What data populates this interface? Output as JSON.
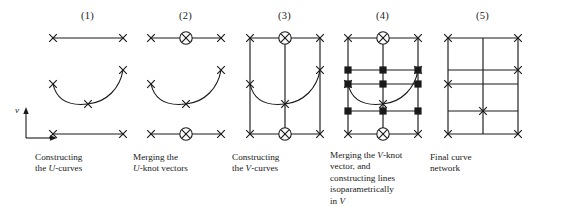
{
  "figure": {
    "background_color": "#ffffff",
    "ink_color": "#1a1a1a",
    "axis": {
      "label_v": "v",
      "name": "v-axis-indicator",
      "origin_x": 26,
      "origin_y": 137,
      "arrow_up_len": 26,
      "arrow_right_len": 30
    },
    "marker_legend": {
      "x_mark": "knot (X cross)",
      "circled_x": "merged knot (X inside circle)",
      "square_x": "isoparametric line node (filled square with X)"
    },
    "panels": [
      {
        "number": "(1)",
        "name": "panel-constructing-u-curves",
        "left": 35,
        "width": 105,
        "caption_lines": [
          "Constructing",
          "the U-curves"
        ],
        "caption_italic_word": "U",
        "caption_plain": "Constructing the U-curves",
        "elements": {
          "top_line": {
            "x1": 18,
            "y1": 12,
            "x2": 88,
            "y2": 12,
            "knots": [
              [
                18,
                12
              ],
              [
                88,
                12
              ]
            ]
          },
          "u_curve": {
            "start": [
              18,
              58
            ],
            "end": [
              88,
              44
            ],
            "bottom": [
              53,
              78
            ],
            "knots": [
              [
                18,
                58
              ],
              [
                53,
                78
              ],
              [
                88,
                44
              ]
            ]
          },
          "bottom_line": {
            "x1": 18,
            "y1": 108,
            "x2": 88,
            "y2": 108,
            "knots": [
              [
                18,
                108
              ],
              [
                88,
                108
              ]
            ]
          }
        }
      },
      {
        "number": "(2)",
        "name": "panel-merging-u-knot-vectors",
        "left": 133,
        "width": 105,
        "caption_lines": [
          "Merging the",
          "U-knot vectors"
        ],
        "caption_italic_word": "U",
        "caption_plain": "Merging the U-knot vectors",
        "elements": {
          "top_line": {
            "x1": 18,
            "y1": 12,
            "x2": 88,
            "y2": 12,
            "knots": [
              [
                18,
                12
              ],
              [
                88,
                12
              ]
            ],
            "circled_knots": [
              [
                53,
                12
              ]
            ]
          },
          "u_curve": {
            "start": [
              18,
              58
            ],
            "end": [
              88,
              44
            ],
            "bottom": [
              53,
              78
            ],
            "knots": [
              [
                18,
                58
              ],
              [
                53,
                78
              ],
              [
                88,
                44
              ]
            ]
          },
          "bottom_line": {
            "x1": 18,
            "y1": 108,
            "x2": 88,
            "y2": 108,
            "knots": [
              [
                18,
                108
              ],
              [
                88,
                108
              ]
            ],
            "circled_knots": [
              [
                53,
                108
              ]
            ]
          }
        }
      },
      {
        "number": "(3)",
        "name": "panel-constructing-v-curves",
        "left": 232,
        "width": 105,
        "caption_lines": [
          "Constructing",
          "the V-curves"
        ],
        "caption_italic_word": "V",
        "caption_plain": "Constructing the V-curves",
        "elements": {
          "rect": {
            "x": 18,
            "y": 12,
            "w": 70,
            "h": 96
          },
          "middle_vertical_x": 53,
          "u_curve": {
            "start": [
              18,
              58
            ],
            "end": [
              88,
              44
            ],
            "bottom": [
              53,
              78
            ]
          },
          "knots": [
            [
              18,
              12
            ],
            [
              88,
              12
            ],
            [
              18,
              108
            ],
            [
              88,
              108
            ],
            [
              18,
              58
            ],
            [
              88,
              44
            ],
            [
              53,
              78
            ]
          ],
          "circled_knots": [
            [
              53,
              12
            ],
            [
              53,
              108
            ]
          ]
        }
      },
      {
        "number": "(4)",
        "name": "panel-merging-v-knot-vector",
        "left": 330,
        "width": 112,
        "caption_lines": [
          "Merging the V-knot",
          "vector, and",
          "constructing lines",
          "isoparametrically",
          "in V"
        ],
        "caption_italic_word": "V",
        "caption_plain": "Merging the V-knot vector, and constructing lines isoparametrically in V",
        "elements": {
          "rect": {
            "x": 18,
            "y": 12,
            "w": 70,
            "h": 96
          },
          "middle_vertical_x": 53,
          "iso_lines_y": [
            44,
            58,
            85
          ],
          "u_curve": {
            "start": [
              18,
              58
            ],
            "end": [
              88,
              44
            ],
            "bottom": [
              53,
              78
            ]
          },
          "knots": [
            [
              18,
              12
            ],
            [
              88,
              12
            ],
            [
              18,
              108
            ],
            [
              88,
              108
            ],
            [
              18,
              58
            ],
            [
              88,
              44
            ],
            [
              53,
              78
            ]
          ],
          "circled_knots": [
            [
              53,
              12
            ],
            [
              53,
              108
            ]
          ],
          "square_knots": [
            [
              18,
              44
            ],
            [
              53,
              44
            ],
            [
              18,
              58
            ],
            [
              53,
              58
            ],
            [
              88,
              58
            ],
            [
              18,
              85
            ],
            [
              53,
              85
            ],
            [
              88,
              85
            ],
            [
              88,
              44
            ]
          ]
        }
      },
      {
        "number": "(5)",
        "name": "panel-final-curve-network",
        "left": 430,
        "width": 105,
        "caption_lines": [
          "Final curve",
          "network"
        ],
        "caption_italic_word": "",
        "caption_plain": "Final curve network",
        "elements": {
          "rect": {
            "x": 18,
            "y": 12,
            "w": 70,
            "h": 96
          },
          "middle_vertical_x": 53,
          "iso_lines_y": [
            44,
            58,
            85
          ],
          "knots": [
            [
              18,
              12
            ],
            [
              88,
              12
            ],
            [
              18,
              108
            ],
            [
              88,
              108
            ],
            [
              18,
              58
            ],
            [
              88,
              44
            ],
            [
              53,
              85
            ]
          ]
        }
      }
    ]
  }
}
